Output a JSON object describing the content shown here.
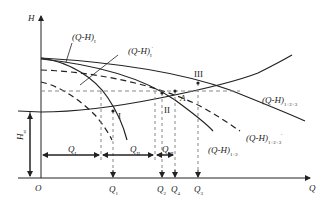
{
  "axes": {
    "y_label": "H",
    "x_label": "Q",
    "origin_label": "O"
  },
  "curves": [
    {
      "id": "QH_I",
      "label": "(Q-H)",
      "sub": "I",
      "sup": "",
      "style": "solid"
    },
    {
      "id": "QH_I_prime",
      "label": "(Q-H)",
      "sub": "I",
      "sup": "′",
      "style": "dashed"
    },
    {
      "id": "QH_123",
      "label": "(Q-H)",
      "sub": "1+2+3",
      "sup": "",
      "style": "solid"
    },
    {
      "id": "QH_123_prime",
      "label": "(Q-H)",
      "sub": "1+2+3",
      "sup": "′",
      "style": "dashed"
    },
    {
      "id": "QH_12",
      "label": "(Q-H)",
      "sub": "1+2",
      "sup": "",
      "style": "solid"
    }
  ],
  "points": {
    "I": "I",
    "II": "II",
    "III": "III",
    "A": "A"
  },
  "dimensions": {
    "H_static": {
      "label": "H",
      "sub": "st"
    },
    "Q_I": {
      "label": "Q",
      "sub": "I"
    },
    "Q_II": {
      "label": "Q",
      "sub": "II"
    },
    "Q_III": {
      "label": "Q",
      "sub": "III"
    }
  },
  "x_ticks": [
    {
      "label": "Q",
      "sub": "1"
    },
    {
      "label": "Q",
      "sub": "2"
    },
    {
      "label": "Q",
      "sub": "4"
    },
    {
      "label": "Q",
      "sub": "3"
    }
  ],
  "colors": {
    "line": "#222222",
    "dash": "#888888"
  }
}
